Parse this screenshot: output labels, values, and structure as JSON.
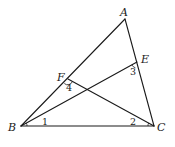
{
  "diagram": {
    "type": "geometry-triangle",
    "stroke_color": "#1a1a1a",
    "background": "#ffffff",
    "points": {
      "A": {
        "label": "A",
        "x": 125,
        "y": 19
      },
      "B": {
        "label": "B",
        "x": 21,
        "y": 126
      },
      "C": {
        "label": "C",
        "x": 154,
        "y": 126
      },
      "E": {
        "label": "E",
        "x": 137,
        "y": 62
      },
      "F": {
        "label": "F",
        "x": 68,
        "y": 79
      }
    },
    "segments": [
      {
        "from": "A",
        "to": "B"
      },
      {
        "from": "A",
        "to": "C"
      },
      {
        "from": "B",
        "to": "C"
      },
      {
        "from": "B",
        "to": "E"
      },
      {
        "from": "C",
        "to": "F"
      }
    ],
    "angle_labels": {
      "angle1": {
        "label": "1",
        "at": "B"
      },
      "angle2": {
        "label": "2",
        "at": "C"
      },
      "angle3": {
        "label": "3",
        "at": "E"
      },
      "angle4": {
        "label": "4",
        "at": "F"
      }
    }
  }
}
